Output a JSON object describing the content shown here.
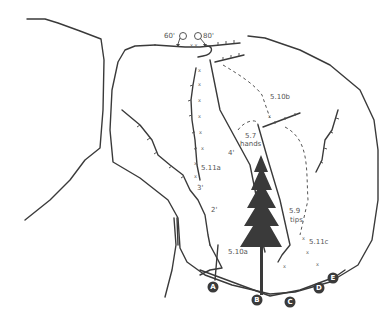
{
  "topo": {
    "rappels": [
      {
        "label": "60'"
      },
      {
        "label": "80'"
      }
    ],
    "routes": [
      {
        "grade": "5.10a",
        "start": "A"
      },
      {
        "grade": "5.11a",
        "start": "A"
      },
      {
        "grade": "5.7",
        "note": "hands",
        "start": "B"
      },
      {
        "grade": "5.10b",
        "start": "C"
      },
      {
        "grade": "5.9",
        "note": "tips",
        "start": "D"
      },
      {
        "grade": "5.11c",
        "start": "E"
      }
    ],
    "pitch_marks": [
      "2'",
      "3'",
      "4'"
    ],
    "start_markers": [
      "A",
      "B",
      "C",
      "D",
      "E"
    ],
    "colors": {
      "line": "#3a3a3a",
      "tree": "#3a3a3a",
      "text": "#555555"
    }
  }
}
